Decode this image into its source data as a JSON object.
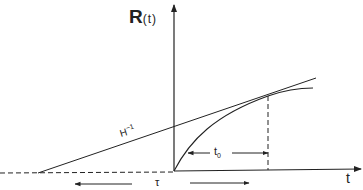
{
  "diagram": {
    "y_axis_label": "R",
    "y_axis_arg": "(t)",
    "x_axis_label": "t",
    "tangent_label_base": "H",
    "tangent_label_exp": "−1",
    "interval_label_base": "t",
    "interval_label_sub": "0",
    "tau_label": "τ",
    "colors": {
      "line": "#222222",
      "background": "#ffffff"
    }
  }
}
